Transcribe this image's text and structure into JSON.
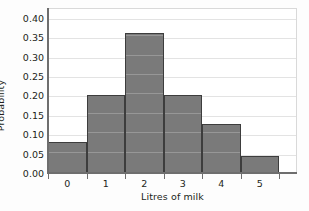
{
  "chart_data": {
    "type": "bar",
    "title": "",
    "xlabel": "Litres of milk",
    "ylabel": "Probability",
    "categories": [
      "0",
      "1",
      "2",
      "3",
      "4",
      "5"
    ],
    "values": [
      0.08,
      0.2,
      0.36,
      0.2,
      0.125,
      0.045
    ],
    "ylim": [
      0.0,
      0.425
    ],
    "yticks": [
      "0.00",
      "0.05",
      "0.10",
      "0.15",
      "0.20",
      "0.25",
      "0.30",
      "0.35",
      "0.40"
    ],
    "ytick_values": [
      0.0,
      0.05,
      0.1,
      0.15,
      0.2,
      0.25,
      0.3,
      0.35,
      0.4
    ],
    "grid": "horizontal",
    "legend": "none",
    "bar_color": "#7a7a7a",
    "bar_edge_color": "#3d3d3d",
    "grid_color": "#e3e3e3",
    "axis_color": "#6e6e6e",
    "plot_background": "#ffffff",
    "figure_background": "#fdfdfd"
  }
}
